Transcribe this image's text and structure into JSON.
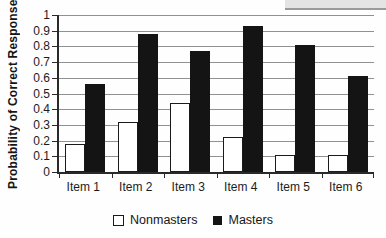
{
  "chart_data": {
    "type": "bar",
    "title": "",
    "categories": [
      "Item 1",
      "Item 2",
      "Item 3",
      "Item 4",
      "Item 5",
      "Item 6"
    ],
    "series": [
      {
        "name": "Nonmasters",
        "values": [
          0.18,
          0.32,
          0.44,
          0.22,
          0.11,
          0.11
        ]
      },
      {
        "name": "Masters",
        "values": [
          0.56,
          0.88,
          0.77,
          0.93,
          0.81,
          0.61
        ]
      }
    ],
    "xlabel": "",
    "ylabel": "Probability of Correct Response",
    "ylim": [
      0,
      1
    ],
    "ytick_step": 0.1,
    "yticks": [
      "1",
      "0.9",
      "0.8",
      "0.7",
      "0.6",
      "0.5",
      "0.4",
      "0.3",
      "0.2",
      "0.1",
      "0"
    ],
    "grid": true,
    "legend_position": "bottom"
  },
  "colors": {
    "nonmasters_fill": "#ffffff",
    "nonmasters_border": "#1a1a1a",
    "masters_fill": "#141414",
    "gridline": "#909090",
    "axis": "#2a2a2a",
    "text": "#1c1c1c",
    "artifact_fill": "#e4e4e4",
    "artifact_edge": "#9a9a9a",
    "background": "#fefefe"
  }
}
